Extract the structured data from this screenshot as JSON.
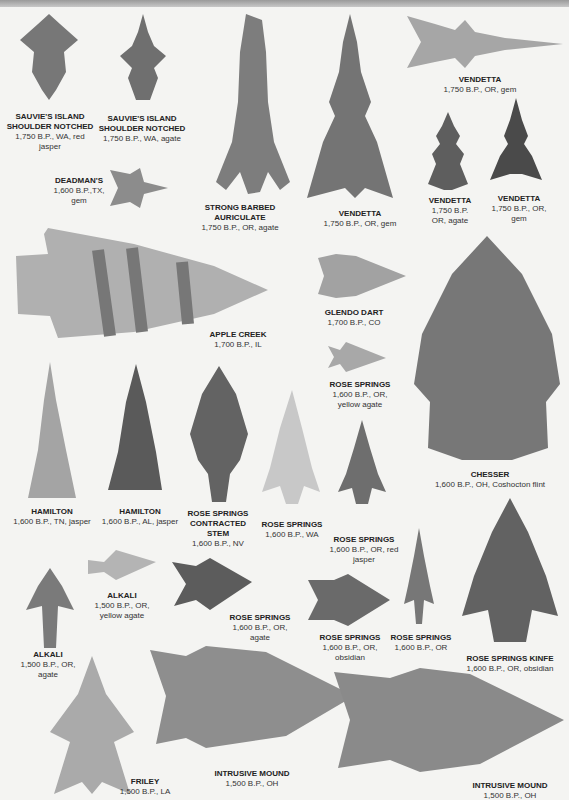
{
  "header": {
    "title_fragment": ""
  },
  "items": [
    {
      "name": "SAUVIE'S ISLAND SHOULDER NOTCHED",
      "details": "1,750 B.P., WA, red jasper"
    },
    {
      "name": "SAUVIE'S ISLAND SHOULDER NOTCHED",
      "details": "1,750 B.P., WA, agate"
    },
    {
      "name": "DEADMAN'S",
      "details": "1,600 B.P.,TX, gem"
    },
    {
      "name": "STRONG BARBED AURICULATE",
      "details": "1,750 B.P., OR, agate"
    },
    {
      "name": "VENDETTA",
      "details": "1,750 B.P., OR, gem"
    },
    {
      "name": "VENDETTA",
      "details": "1,750 B.P., OR, gem"
    },
    {
      "name": "VENDETTA",
      "details": "1,750 B.P. OR, agate"
    },
    {
      "name": "VENDETTA",
      "details": "1,750 B.P., OR, gem"
    },
    {
      "name": "APPLE CREEK",
      "details": "1,700 B.P., IL"
    },
    {
      "name": "GLENDO DART",
      "details": "1,700 B.P., CO"
    },
    {
      "name": "ROSE SPRINGS",
      "details": "1,600 B.P., OR, yellow agate"
    },
    {
      "name": "CHESSER",
      "details": "1,600 B.P., OH, Coshocton flint"
    },
    {
      "name": "HAMILTON",
      "details": "1,600 B.P., TN, jasper"
    },
    {
      "name": "HAMILTON",
      "details": "1,600 B.P., AL, jasper"
    },
    {
      "name": "ROSE SPRINGS CONTRACTED STEM",
      "details": "1,600 B.P., NV"
    },
    {
      "name": "ROSE SPRINGS",
      "details": "1,600 B.P., WA"
    },
    {
      "name": "ROSE SPRINGS",
      "details": "1,600 B.P., OR, red jasper"
    },
    {
      "name": "ALKALI",
      "details": "1,500 B.P., OR, yellow agate"
    },
    {
      "name": "ALKALI",
      "details": "1,500 B.P., OR, agate"
    },
    {
      "name": "ROSE SPRINGS",
      "details": "1,600 B.P., OR, agate"
    },
    {
      "name": "ROSE SPRINGS",
      "details": "1,600 B.P., OR, obsidian"
    },
    {
      "name": "ROSE SPRINGS",
      "details": "1,600 B.P., OR"
    },
    {
      "name": "ROSE SPRINGS KINFE",
      "details": "1,600 B.P., OR, obsidian"
    },
    {
      "name": "FRILEY",
      "details": "1,500 B.P., LA"
    },
    {
      "name": "INTRUSIVE MOUND",
      "details": "1,500 B.P., OH"
    },
    {
      "name": "INTRUSIVE MOUND",
      "details": "1,500 B.P., OH"
    }
  ],
  "colors": {
    "background": "#f4f4f2",
    "stone_dark": "#5e5e5e",
    "stone_mid": "#8a8a8a",
    "stone_light": "#b8b8b8"
  }
}
